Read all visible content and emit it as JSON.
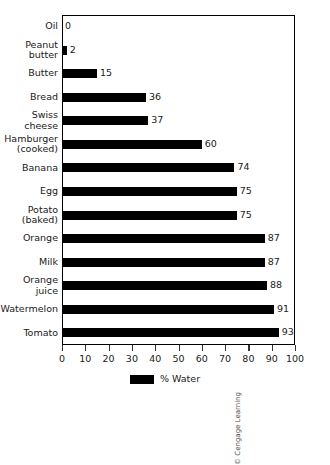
{
  "chart_data": {
    "type": "bar",
    "orientation": "horizontal",
    "title": "",
    "xlabel": "",
    "ylabel": "",
    "xlim": [
      0,
      100
    ],
    "xticks": [
      0,
      10,
      20,
      30,
      40,
      50,
      60,
      70,
      80,
      90,
      100
    ],
    "grid": false,
    "legend_position": "bottom-center",
    "legend": [
      "% Water"
    ],
    "series_color": "#000000",
    "categories": [
      "Oil",
      "Peanut\nbutter",
      "Butter",
      "Bread",
      "Swiss\ncheese",
      "Hamburger\n(cooked)",
      "Banana",
      "Egg",
      "Potato\n(baked)",
      "Orange",
      "Milk",
      "Orange\njuice",
      "Watermelon",
      "Tomato"
    ],
    "values": [
      0,
      2,
      15,
      36,
      37,
      60,
      74,
      75,
      75,
      87,
      87,
      88,
      91,
      93
    ],
    "value_labels": [
      "0",
      "2",
      "15",
      "36",
      "37",
      "60",
      "74",
      "75",
      "75",
      "87",
      "87",
      "88",
      "91",
      "93"
    ],
    "series": [
      {
        "name": "% Water",
        "values": [
          0,
          2,
          15,
          36,
          37,
          60,
          74,
          75,
          75,
          87,
          87,
          88,
          91,
          93
        ]
      }
    ]
  },
  "legend": {
    "label": "% Water"
  },
  "axis": {
    "tick_labels": [
      "0",
      "10",
      "20",
      "30",
      "40",
      "50",
      "60",
      "70",
      "80",
      "90",
      "100"
    ]
  },
  "credit": {
    "text": "© Cengage Learning"
  }
}
